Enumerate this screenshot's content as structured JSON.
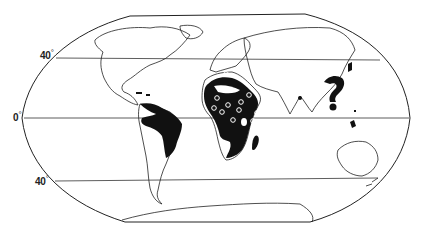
{
  "map": {
    "projection": "world-oval",
    "colors": {
      "land_outline": "#222222",
      "shaded_region": "#111111",
      "background": "#ffffff",
      "grid_line": "#333333"
    },
    "latitude_labels": [
      {
        "value": "40",
        "unit": "°",
        "line": "north-40"
      },
      {
        "value": "0",
        "unit": "°",
        "line": "equator"
      },
      {
        "value": "40",
        "unit": "°",
        "line": "south-40"
      }
    ],
    "shaded_regions": [
      "Central America / Caribbean",
      "Northern South America (Amazon/Brazil)",
      "Sub-Saharan Africa",
      "Madagascar",
      "Southern China",
      "Japan (south)",
      "Southeast Asia",
      "India (south tip)",
      "Indonesia / New Guinea"
    ],
    "point_markers": {
      "symbol": "open-circle",
      "region": "Africa",
      "count": 11
    }
  }
}
